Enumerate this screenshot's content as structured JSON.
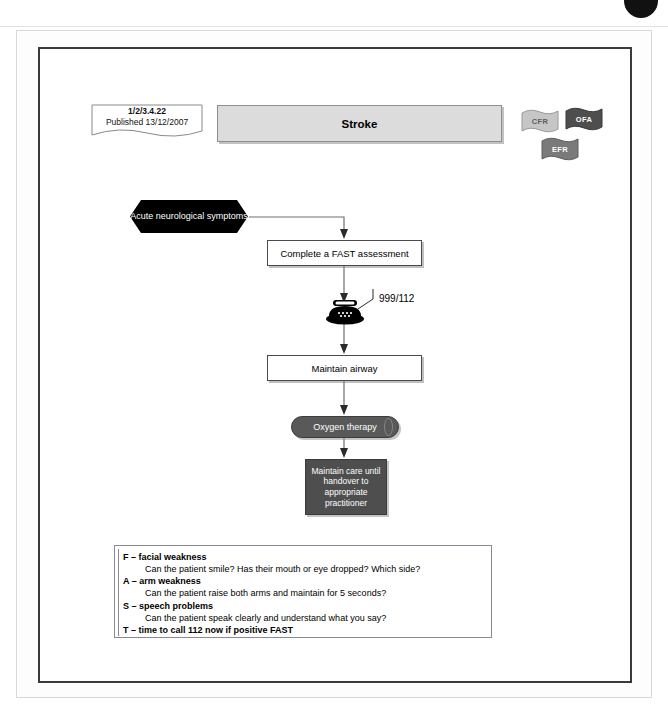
{
  "viewer": {
    "ghost_text": "",
    "badge_icon": "dark-circle-icon"
  },
  "document": {
    "reference_code": "1/2/3.4.22",
    "published_label": "Published 13/12/2007",
    "title": "Stroke"
  },
  "scope_badges": [
    {
      "id": "cfr",
      "label": "CFR",
      "color": "#c6c6c6",
      "text_color": "#5d5d5d"
    },
    {
      "id": "ofa",
      "label": "OFA",
      "color": "#4e4e4e",
      "text_color": "#ffffff"
    },
    {
      "id": "efr",
      "label": "EFR",
      "color": "#7a7a7a",
      "text_color": "#ffffff"
    }
  ],
  "flow": {
    "start_node": "Acute neurological symptoms",
    "fast_assessment": "Complete a FAST assessment",
    "emergency_number": "999/112",
    "phone_icon": "telephone-icon",
    "maintain_airway": "Maintain airway",
    "oxygen_therapy": "Oxygen therapy",
    "maintain_care": "Maintain care until handover to appropriate practitioner"
  },
  "fast_legend": [
    {
      "heading": "F – facial weakness",
      "detail": "Can the patient smile? Has their mouth or eye dropped? Which side?"
    },
    {
      "heading": "A – arm weakness",
      "detail": "Can the patient raise both arms and maintain for 5 seconds?"
    },
    {
      "heading": "S – speech problems",
      "detail": "Can the patient speak clearly and understand what you say?"
    },
    {
      "heading": "T – time to call 112 now if positive FAST",
      "detail": ""
    }
  ],
  "colors": {
    "banner_fill": "#dcdcdc",
    "start_node_fill": "#000000",
    "oxygen_fill": "#595959",
    "maintain_care_fill": "#4e4e4e",
    "frame_border": "#3a3a3a"
  }
}
